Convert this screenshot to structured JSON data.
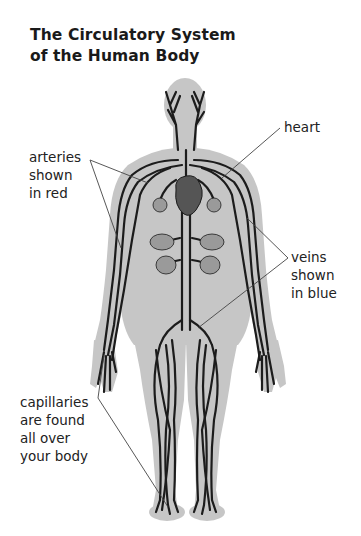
{
  "title": {
    "line1": "The Circulatory System",
    "line2": "of the Human Body"
  },
  "labels": {
    "arteries": {
      "line1": "arteries",
      "line2": "shown",
      "line3": "in red"
    },
    "heart": {
      "line1": "heart"
    },
    "veins": {
      "line1": "veins",
      "line2": "shown",
      "line3": "in blue"
    },
    "capillaries": {
      "line1": "capillaries",
      "line2": "are found",
      "line3": "all over",
      "line4": "your body"
    }
  },
  "colors": {
    "background": "#ffffff",
    "body_silhouette": "#c4c4c4",
    "vessels": "#1c1c1c",
    "heart": "#555555",
    "pointer_lines": "#444444",
    "text": "#222222"
  }
}
